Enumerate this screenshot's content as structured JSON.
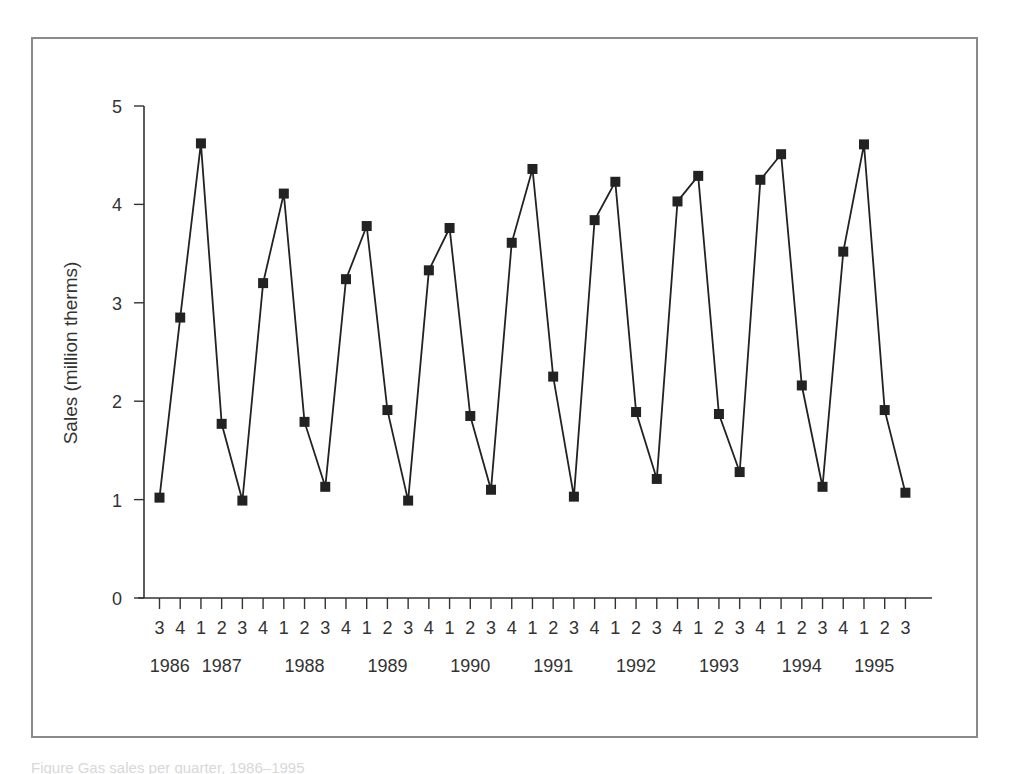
{
  "figure": {
    "caption": "Figure   Gas sales per quarter, 1986–1995"
  },
  "colors": {
    "frame": "#8a8a8a",
    "axis": "#333333",
    "series": "#222222",
    "text": "#333333"
  },
  "chart_data": {
    "type": "line",
    "title": "",
    "xlabel": "",
    "ylabel": "Sales (million therms)",
    "ylim": [
      0,
      5
    ],
    "yticks": [
      0,
      1,
      2,
      3,
      4,
      5
    ],
    "grid": false,
    "legend": null,
    "marker": "square",
    "quarter_labels": [
      "3",
      "4",
      "1",
      "2",
      "3",
      "4",
      "1",
      "2",
      "3",
      "4",
      "1",
      "2",
      "3",
      "4",
      "1",
      "2",
      "3",
      "4",
      "1",
      "2",
      "3",
      "4",
      "1",
      "2",
      "3",
      "4",
      "1",
      "2",
      "3",
      "4",
      "1",
      "2",
      "3",
      "4",
      "1",
      "2",
      "3"
    ],
    "year_labels": [
      {
        "label": "1986",
        "index": 0.5
      },
      {
        "label": "1987",
        "index": 3.0
      },
      {
        "label": "1988",
        "index": 7.0
      },
      {
        "label": "1989",
        "index": 11.0
      },
      {
        "label": "1990",
        "index": 15.0
      },
      {
        "label": "1991",
        "index": 19.0
      },
      {
        "label": "1992",
        "index": 23.0
      },
      {
        "label": "1993",
        "index": 27.0
      },
      {
        "label": "1994",
        "index": 31.0
      },
      {
        "label": "1995",
        "index": 34.5
      }
    ],
    "categories": [
      "1986 Q3",
      "1986 Q4",
      "1987 Q1",
      "1987 Q2",
      "1987 Q3",
      "1987 Q4",
      "1988 Q1",
      "1988 Q2",
      "1988 Q3",
      "1988 Q4",
      "1989 Q1",
      "1989 Q2",
      "1989 Q3",
      "1989 Q4",
      "1990 Q1",
      "1990 Q2",
      "1990 Q3",
      "1990 Q4",
      "1991 Q1",
      "1991 Q2",
      "1991 Q3",
      "1991 Q4",
      "1992 Q1",
      "1992 Q2",
      "1992 Q3",
      "1992 Q4",
      "1993 Q1",
      "1993 Q2",
      "1993 Q3",
      "1993 Q4",
      "1994 Q1",
      "1994 Q2",
      "1994 Q3",
      "1994 Q4",
      "1995 Q1",
      "1995 Q2",
      "1995 Q3"
    ],
    "series": [
      {
        "name": "Sales",
        "values": [
          1.02,
          2.85,
          4.62,
          1.77,
          0.99,
          3.2,
          4.11,
          1.79,
          1.13,
          3.24,
          3.78,
          1.91,
          0.99,
          3.33,
          3.76,
          1.85,
          1.1,
          3.61,
          4.36,
          2.25,
          1.03,
          3.84,
          4.23,
          1.89,
          1.21,
          4.03,
          4.29,
          1.87,
          1.28,
          4.25,
          4.51,
          2.16,
          1.13,
          3.52,
          4.61,
          1.91,
          1.07
        ]
      }
    ]
  }
}
